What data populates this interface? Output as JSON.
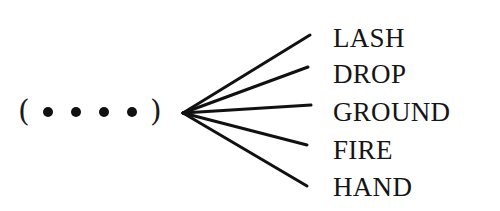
{
  "puzzle": {
    "left_paren": "(",
    "right_paren": ")",
    "blank_count": 4,
    "words": [
      "LASH",
      "DROP",
      "GROUND",
      "FIRE",
      "HAND"
    ]
  },
  "colors": {
    "ink": "#111111",
    "background": "#ffffff"
  }
}
